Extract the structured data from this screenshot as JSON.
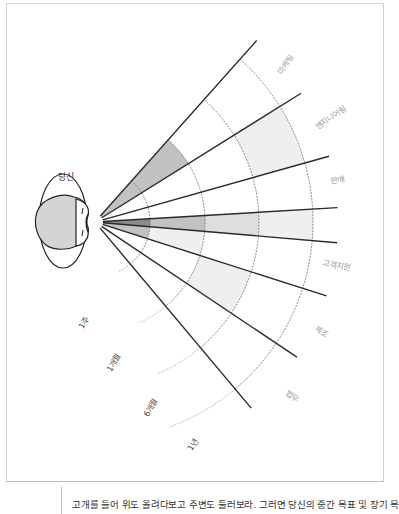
{
  "figure": {
    "you_label": "당신",
    "origin": [
      95,
      222
    ],
    "ring_radii": [
      55,
      110,
      164,
      218
    ],
    "line_length": 243,
    "line_angles_deg": [
      -48.3,
      -32.0,
      -15.7,
      -3.4,
      4.9,
      17.7,
      33.8,
      50.0
    ],
    "shade_colors": {
      "dark": "#8c8c8c",
      "medium": "#c2c2c2",
      "light": "#dedede",
      "faint": "#efefef",
      "none": "none"
    },
    "departments": [
      {
        "label": "마케팅",
        "rings": [
          "medium",
          "medium",
          "none",
          "none"
        ],
        "label_pos": [
          288,
          66
        ],
        "label_rot": -58
      },
      {
        "label": "엔지니어링",
        "rings": [
          "none",
          "none",
          "none",
          "faint"
        ],
        "label_pos": [
          332,
          120
        ],
        "label_rot": -35
      },
      {
        "label": "판매",
        "rings": [
          "none",
          "none",
          "none",
          "none"
        ],
        "label_pos": [
          338,
          183
        ],
        "label_rot": -10
      },
      {
        "label": "",
        "rings": [
          "dark",
          "medium",
          "light",
          "faint"
        ],
        "label_pos": null,
        "label_rot": 0
      },
      {
        "label": "고객지원",
        "rings": [
          "medium",
          "faint",
          "none",
          "none"
        ],
        "label_pos": [
          336,
          268
        ],
        "label_rot": 12
      },
      {
        "label": "제조",
        "rings": [
          "none",
          "none",
          "faint",
          "none"
        ],
        "label_pos": [
          320,
          334
        ],
        "label_rot": 32
      },
      {
        "label": "법무",
        "rings": [
          "none",
          "none",
          "none",
          "none"
        ],
        "label_pos": [
          290,
          398
        ],
        "label_rot": 40
      }
    ],
    "time_labels": [
      {
        "label": "1주",
        "pos": [
          86,
          324
        ],
        "rot": -60
      },
      {
        "label": "1개월",
        "pos": [
          116,
          364
        ],
        "rot": -60
      },
      {
        "label": "6개월",
        "pos": [
          153,
          409
        ],
        "rot": -60
      },
      {
        "label": "1년",
        "pos": [
          195,
          446
        ],
        "rot": -60
      }
    ]
  },
  "caption": {
    "text": "고개를 들어 위도 올려다보고 주변도 둘러보라. 그러면 당신의 중간 목표 및 장기 목"
  }
}
